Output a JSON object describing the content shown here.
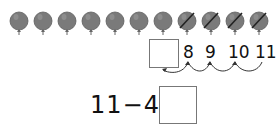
{
  "balloons": {
    "total": 11,
    "crossed_out": 4,
    "color": "#7a7a7a",
    "items": [
      {
        "cx": 19,
        "crossed": false
      },
      {
        "cx": 43,
        "crossed": false
      },
      {
        "cx": 67,
        "crossed": false
      },
      {
        "cx": 91,
        "crossed": false
      },
      {
        "cx": 115,
        "crossed": false
      },
      {
        "cx": 139,
        "crossed": false
      },
      {
        "cx": 163,
        "crossed": false
      },
      {
        "cx": 187,
        "crossed": true
      },
      {
        "cx": 211,
        "crossed": true
      },
      {
        "cx": 235,
        "crossed": true
      },
      {
        "cx": 259,
        "crossed": true
      }
    ]
  },
  "number_line": {
    "blank_box": "",
    "numbers": [
      "8",
      "9",
      "10",
      "11"
    ]
  },
  "equation": {
    "text": "11−4=",
    "answer": ""
  }
}
